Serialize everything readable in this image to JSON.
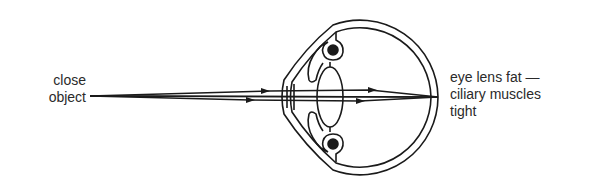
{
  "diagram": {
    "object_label": [
      "close",
      "object"
    ],
    "eye_state_label": [
      "eye lens fat —",
      "ciliary muscles",
      "tight"
    ],
    "colors": {
      "ink": "#1a1a1a",
      "text": "#2a2a2a",
      "background": "#ffffff"
    },
    "elements": [
      "light rays",
      "cornea",
      "sclera",
      "lens",
      "ciliary muscles",
      "retina focal point"
    ]
  }
}
